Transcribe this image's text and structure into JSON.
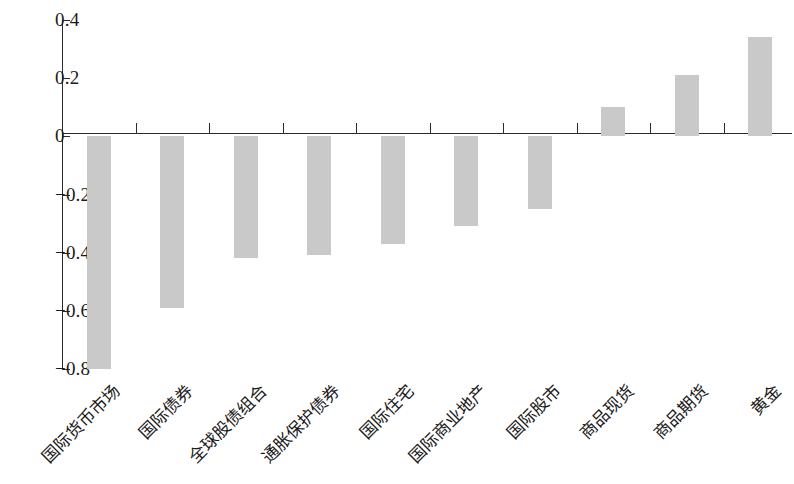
{
  "chart_data": {
    "type": "bar",
    "title": "",
    "subtitle": "",
    "xlabel": "",
    "ylabel": "",
    "ylim": [
      -0.8,
      0.4
    ],
    "yticks": [
      0.4,
      0.2,
      0,
      -0.2,
      -0.4,
      -0.6,
      -0.8
    ],
    "ytick_labels": [
      "0.4",
      "0.2",
      "0",
      "−0.2",
      "−0.4",
      "−0.6",
      "−0.8"
    ],
    "grid": false,
    "legend": null,
    "bar_color": "#c9c9c9",
    "axis_color": "#2b2b2b",
    "categories": [
      "国际货币市场",
      "国际债券",
      "全球股债组合",
      "通胀保护债券",
      "国际住宅",
      "国际商业地产",
      "国际股市",
      "商品现货",
      "商品期货",
      "黄金"
    ],
    "values": [
      -0.8,
      -0.59,
      -0.42,
      -0.41,
      -0.37,
      -0.31,
      -0.25,
      0.1,
      0.21,
      0.34
    ]
  }
}
